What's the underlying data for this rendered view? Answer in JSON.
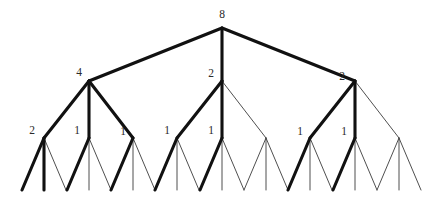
{
  "diagram": {
    "type": "tree",
    "branching_factor": 3,
    "depth": 3,
    "colors": {
      "background": "#ffffff",
      "thin_edge": "#3b3b3b",
      "thick_edge": "#111111",
      "label": "#2a2a2a"
    },
    "edge_styles": {
      "thin": "thin",
      "thick": "thick"
    }
  },
  "nodes": [
    {
      "id": "root",
      "label": "8",
      "level": 0,
      "x": 222,
      "y": 28,
      "label_x": 222,
      "label_y": 18,
      "labeled": true
    },
    {
      "id": "n0",
      "label": "4",
      "level": 1,
      "x": 89,
      "y": 81,
      "label_x": 79,
      "label_y": 76,
      "labeled": true
    },
    {
      "id": "n1",
      "label": "2",
      "level": 1,
      "x": 222,
      "y": 81,
      "label_x": 211,
      "label_y": 77,
      "labeled": true
    },
    {
      "id": "n2",
      "label": "2",
      "level": 1,
      "x": 355,
      "y": 81,
      "label_x": 342,
      "label_y": 80,
      "labeled": true
    },
    {
      "id": "n00",
      "label": "2",
      "level": 2,
      "x": 44,
      "y": 138,
      "label_x": 32,
      "label_y": 134,
      "labeled": true
    },
    {
      "id": "n01",
      "label": "1",
      "level": 2,
      "x": 89,
      "y": 138,
      "label_x": 77,
      "label_y": 134,
      "labeled": true
    },
    {
      "id": "n02",
      "label": "1",
      "level": 2,
      "x": 133,
      "y": 138,
      "label_x": 123,
      "label_y": 135,
      "labeled": true
    },
    {
      "id": "n10",
      "label": "1",
      "level": 2,
      "x": 177,
      "y": 138,
      "label_x": 167,
      "label_y": 134,
      "labeled": true
    },
    {
      "id": "n11",
      "label": "1",
      "level": 2,
      "x": 222,
      "y": 138,
      "label_x": 211,
      "label_y": 134,
      "labeled": true
    },
    {
      "id": "n12",
      "label": "",
      "level": 2,
      "x": 266,
      "y": 138,
      "label_x": 255,
      "label_y": 134,
      "labeled": false
    },
    {
      "id": "n20",
      "label": "1",
      "level": 2,
      "x": 310,
      "y": 138,
      "label_x": 300,
      "label_y": 135,
      "labeled": true
    },
    {
      "id": "n21",
      "label": "1",
      "level": 2,
      "x": 355,
      "y": 138,
      "label_x": 344,
      "label_y": 135,
      "labeled": true
    },
    {
      "id": "n22",
      "label": "",
      "level": 2,
      "x": 399,
      "y": 138,
      "label_x": 388,
      "label_y": 135,
      "labeled": false
    },
    {
      "id": "l000",
      "label": "",
      "level": 3,
      "x": 22,
      "y": 190,
      "labeled": false
    },
    {
      "id": "l001",
      "label": "",
      "level": 3,
      "x": 44,
      "y": 190,
      "labeled": false
    },
    {
      "id": "l002",
      "label": "",
      "level": 3,
      "x": 66,
      "y": 190,
      "labeled": false
    },
    {
      "id": "l010",
      "label": "",
      "level": 3,
      "x": 67,
      "y": 190,
      "labeled": false
    },
    {
      "id": "l011",
      "label": "",
      "level": 3,
      "x": 89,
      "y": 190,
      "labeled": false
    },
    {
      "id": "l012",
      "label": "",
      "level": 3,
      "x": 111,
      "y": 190,
      "labeled": false
    },
    {
      "id": "l020",
      "label": "",
      "level": 3,
      "x": 111,
      "y": 190,
      "labeled": false
    },
    {
      "id": "l021",
      "label": "",
      "level": 3,
      "x": 133,
      "y": 190,
      "labeled": false
    },
    {
      "id": "l022",
      "label": "",
      "level": 3,
      "x": 155,
      "y": 190,
      "labeled": false
    },
    {
      "id": "l100",
      "label": "",
      "level": 3,
      "x": 155,
      "y": 190,
      "labeled": false
    },
    {
      "id": "l101",
      "label": "",
      "level": 3,
      "x": 177,
      "y": 190,
      "labeled": false
    },
    {
      "id": "l102",
      "label": "",
      "level": 3,
      "x": 199,
      "y": 190,
      "labeled": false
    },
    {
      "id": "l110",
      "label": "",
      "level": 3,
      "x": 200,
      "y": 190,
      "labeled": false
    },
    {
      "id": "l111",
      "label": "",
      "level": 3,
      "x": 222,
      "y": 190,
      "labeled": false
    },
    {
      "id": "l112",
      "label": "",
      "level": 3,
      "x": 244,
      "y": 190,
      "labeled": false
    },
    {
      "id": "l120",
      "label": "",
      "level": 3,
      "x": 244,
      "y": 190,
      "labeled": false
    },
    {
      "id": "l121",
      "label": "",
      "level": 3,
      "x": 266,
      "y": 190,
      "labeled": false
    },
    {
      "id": "l122",
      "label": "",
      "level": 3,
      "x": 288,
      "y": 190,
      "labeled": false
    },
    {
      "id": "l200",
      "label": "",
      "level": 3,
      "x": 288,
      "y": 190,
      "labeled": false
    },
    {
      "id": "l201",
      "label": "",
      "level": 3,
      "x": 310,
      "y": 190,
      "labeled": false
    },
    {
      "id": "l202",
      "label": "",
      "level": 3,
      "x": 332,
      "y": 190,
      "labeled": false
    },
    {
      "id": "l210",
      "label": "",
      "level": 3,
      "x": 333,
      "y": 190,
      "labeled": false
    },
    {
      "id": "l211",
      "label": "",
      "level": 3,
      "x": 355,
      "y": 190,
      "labeled": false
    },
    {
      "id": "l212",
      "label": "",
      "level": 3,
      "x": 377,
      "y": 190,
      "labeled": false
    },
    {
      "id": "l220",
      "label": "",
      "level": 3,
      "x": 377,
      "y": 190,
      "labeled": false
    },
    {
      "id": "l221",
      "label": "",
      "level": 3,
      "x": 399,
      "y": 190,
      "labeled": false
    },
    {
      "id": "l222",
      "label": "",
      "level": 3,
      "x": 421,
      "y": 190,
      "labeled": false
    }
  ],
  "edges": [
    {
      "from": "root",
      "to": "n0",
      "style": "thick"
    },
    {
      "from": "root",
      "to": "n1",
      "style": "thick"
    },
    {
      "from": "root",
      "to": "n2",
      "style": "thick"
    },
    {
      "from": "n0",
      "to": "n00",
      "style": "thick"
    },
    {
      "from": "n0",
      "to": "n01",
      "style": "thick"
    },
    {
      "from": "n0",
      "to": "n02",
      "style": "thick"
    },
    {
      "from": "n1",
      "to": "n10",
      "style": "thick"
    },
    {
      "from": "n1",
      "to": "n11",
      "style": "thick"
    },
    {
      "from": "n1",
      "to": "n12",
      "style": "thin"
    },
    {
      "from": "n2",
      "to": "n20",
      "style": "thick"
    },
    {
      "from": "n2",
      "to": "n21",
      "style": "thick"
    },
    {
      "from": "n2",
      "to": "n22",
      "style": "thin"
    },
    {
      "from": "n00",
      "to": "l000",
      "style": "thick"
    },
    {
      "from": "n00",
      "to": "l001",
      "style": "thick"
    },
    {
      "from": "n00",
      "to": "l002",
      "style": "thin"
    },
    {
      "from": "n01",
      "to": "l010",
      "style": "thick"
    },
    {
      "from": "n01",
      "to": "l011",
      "style": "thin"
    },
    {
      "from": "n01",
      "to": "l012",
      "style": "thin"
    },
    {
      "from": "n02",
      "to": "l020",
      "style": "thick"
    },
    {
      "from": "n02",
      "to": "l021",
      "style": "thin"
    },
    {
      "from": "n02",
      "to": "l022",
      "style": "thin"
    },
    {
      "from": "n10",
      "to": "l100",
      "style": "thick"
    },
    {
      "from": "n10",
      "to": "l101",
      "style": "thin"
    },
    {
      "from": "n10",
      "to": "l102",
      "style": "thin"
    },
    {
      "from": "n11",
      "to": "l110",
      "style": "thick"
    },
    {
      "from": "n11",
      "to": "l111",
      "style": "thin"
    },
    {
      "from": "n11",
      "to": "l112",
      "style": "thin"
    },
    {
      "from": "n12",
      "to": "l120",
      "style": "thin"
    },
    {
      "from": "n12",
      "to": "l121",
      "style": "thin"
    },
    {
      "from": "n12",
      "to": "l122",
      "style": "thin"
    },
    {
      "from": "n20",
      "to": "l200",
      "style": "thick"
    },
    {
      "from": "n20",
      "to": "l201",
      "style": "thin"
    },
    {
      "from": "n20",
      "to": "l202",
      "style": "thin"
    },
    {
      "from": "n21",
      "to": "l210",
      "style": "thick"
    },
    {
      "from": "n21",
      "to": "l211",
      "style": "thin"
    },
    {
      "from": "n21",
      "to": "l212",
      "style": "thin"
    },
    {
      "from": "n22",
      "to": "l220",
      "style": "thin"
    },
    {
      "from": "n22",
      "to": "l221",
      "style": "thin"
    },
    {
      "from": "n22",
      "to": "l222",
      "style": "thin"
    }
  ]
}
